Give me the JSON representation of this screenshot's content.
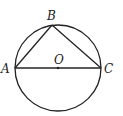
{
  "diagram": {
    "type": "geometry",
    "circle": {
      "center": "O",
      "cx": 58,
      "cy": 68,
      "r": 43
    },
    "points": {
      "A": {
        "label": "A",
        "x": 15,
        "y": 68
      },
      "B": {
        "label": "B",
        "x": 52,
        "y": 25
      },
      "C": {
        "label": "C",
        "x": 101,
        "y": 68
      },
      "O": {
        "label": "O",
        "x": 58,
        "y": 68
      }
    },
    "segments": [
      [
        "A",
        "B"
      ],
      [
        "B",
        "C"
      ],
      [
        "A",
        "C"
      ]
    ],
    "stroke_color": "#222222"
  }
}
